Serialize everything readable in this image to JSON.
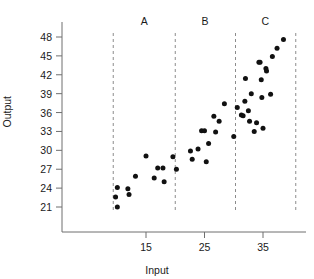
{
  "chart_data": {
    "type": "scatter",
    "title": "",
    "xlabel": "Input",
    "ylabel": "Output",
    "xlim": [
      8,
      42
    ],
    "ylim": [
      19.5,
      49.5
    ],
    "grid": false,
    "legend": "none",
    "xticks": [
      15,
      25,
      35
    ],
    "yticks": [
      21,
      24,
      27,
      30,
      33,
      36,
      39,
      42,
      45,
      48
    ],
    "marker": "filled-circle",
    "marker_color": "#111111",
    "axis_color": "#6f6f6f",
    "vlines": {
      "style": "dashed",
      "color": "#8c8c8c",
      "x": [
        9.4,
        20.0,
        30.3,
        40.6
      ]
    },
    "region_labels": [
      {
        "label": "A",
        "x": 14.7
      },
      {
        "label": "B",
        "x": 25.1
      },
      {
        "label": "C",
        "x": 35.4
      }
    ],
    "points": [
      {
        "x": 9.8,
        "y": 22.6
      },
      {
        "x": 10.1,
        "y": 24.1
      },
      {
        "x": 10.1,
        "y": 21.0
      },
      {
        "x": 11.9,
        "y": 23.9
      },
      {
        "x": 12.1,
        "y": 23.0
      },
      {
        "x": 13.2,
        "y": 25.9
      },
      {
        "x": 15.0,
        "y": 29.1
      },
      {
        "x": 16.4,
        "y": 25.6
      },
      {
        "x": 17.0,
        "y": 27.2
      },
      {
        "x": 17.9,
        "y": 27.2
      },
      {
        "x": 18.1,
        "y": 25.0
      },
      {
        "x": 19.6,
        "y": 29.0
      },
      {
        "x": 20.2,
        "y": 27.0
      },
      {
        "x": 22.6,
        "y": 29.9
      },
      {
        "x": 22.9,
        "y": 28.6
      },
      {
        "x": 23.9,
        "y": 30.2
      },
      {
        "x": 24.5,
        "y": 33.1
      },
      {
        "x": 25.0,
        "y": 33.1
      },
      {
        "x": 25.3,
        "y": 28.2
      },
      {
        "x": 25.7,
        "y": 31.1
      },
      {
        "x": 26.6,
        "y": 35.4
      },
      {
        "x": 26.9,
        "y": 32.9
      },
      {
        "x": 27.5,
        "y": 34.6
      },
      {
        "x": 28.4,
        "y": 37.4
      },
      {
        "x": 30.0,
        "y": 32.2
      },
      {
        "x": 30.6,
        "y": 36.8
      },
      {
        "x": 31.3,
        "y": 35.6
      },
      {
        "x": 31.6,
        "y": 35.5
      },
      {
        "x": 31.9,
        "y": 37.8
      },
      {
        "x": 32.0,
        "y": 41.4
      },
      {
        "x": 32.5,
        "y": 36.3
      },
      {
        "x": 32.7,
        "y": 34.6
      },
      {
        "x": 33.0,
        "y": 39.0
      },
      {
        "x": 33.5,
        "y": 33.0
      },
      {
        "x": 33.9,
        "y": 34.4
      },
      {
        "x": 34.3,
        "y": 44.0
      },
      {
        "x": 34.5,
        "y": 44.0
      },
      {
        "x": 34.7,
        "y": 41.2
      },
      {
        "x": 34.8,
        "y": 38.4
      },
      {
        "x": 35.0,
        "y": 33.5
      },
      {
        "x": 35.5,
        "y": 43.0
      },
      {
        "x": 35.6,
        "y": 42.6
      },
      {
        "x": 36.3,
        "y": 38.9
      },
      {
        "x": 36.6,
        "y": 44.9
      },
      {
        "x": 37.4,
        "y": 46.2
      },
      {
        "x": 38.5,
        "y": 47.6
      }
    ]
  },
  "axes": {
    "ylabel": "Output",
    "xlabel": "Input"
  }
}
